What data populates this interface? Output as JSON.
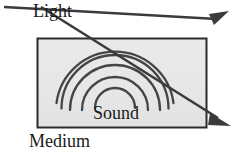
{
  "figure": {
    "labels": {
      "light": "Light",
      "sound": "Sound",
      "medium": "Medium"
    },
    "colors": {
      "medium_fill": "#e9e9e9",
      "medium_border": "#2b2b2b",
      "wave_stroke": "#3a3a3a",
      "ray_stroke": "#3b3b3b",
      "text": "#1a1a1a",
      "background": "#ffffff"
    },
    "medium_rect": {
      "x": 37,
      "y": 38,
      "width": 170,
      "height": 90
    },
    "sound_waves": {
      "center_x": 115,
      "center_y": 107,
      "arc_count": 5,
      "radii": [
        24,
        36,
        47,
        58,
        68
      ],
      "description": "concentric upward-opening arcs radiating from bottom center"
    },
    "rays": [
      {
        "name": "light-ray-up",
        "from_x": 4,
        "from_y": 7,
        "to_x": 229,
        "to_y": 13,
        "arrowhead": "end",
        "direction": "up-right"
      },
      {
        "name": "light-ray-down",
        "from_x": 40,
        "from_y": 6,
        "to_x": 231,
        "to_y": 126,
        "arrowhead": "end",
        "direction": "down-right"
      }
    ]
  }
}
